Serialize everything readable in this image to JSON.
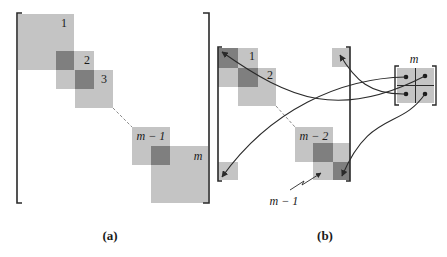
{
  "figure": {
    "colors": {
      "light_block": "#c4c4c4",
      "dark_block": "#7f7f7f",
      "line": "#2a2a2a",
      "dashed": "#8a8a8a"
    },
    "panel_a": {
      "caption": "(a)",
      "blocks": [
        {
          "label": "1"
        },
        {
          "label": "2"
        },
        {
          "label": "3"
        },
        {
          "label": "m − 1"
        },
        {
          "label": "m"
        }
      ]
    },
    "panel_b": {
      "caption": "(b)",
      "labels": {
        "block1": "1",
        "block2": "2",
        "block_m_minus_2": "m − 2",
        "pointer_m_minus_1": "m − 1",
        "small_matrix": "m"
      }
    }
  }
}
